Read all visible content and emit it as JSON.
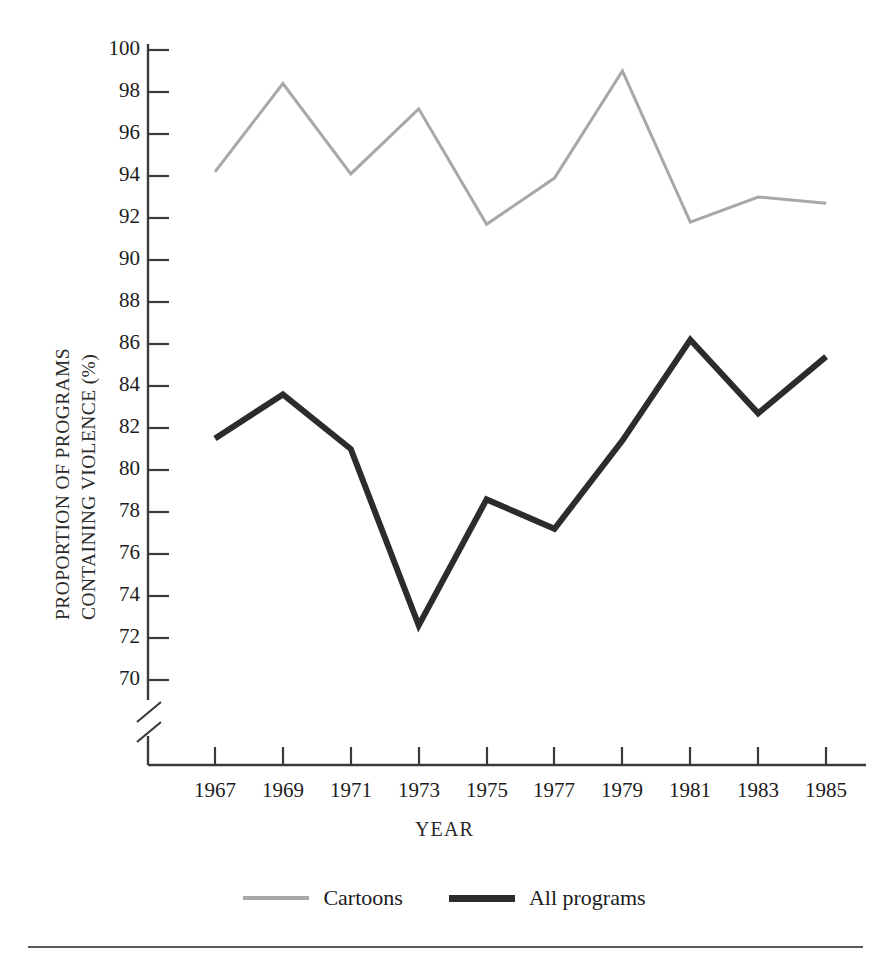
{
  "chart_data": {
    "type": "line",
    "title": "",
    "xlabel": "YEAR",
    "ylabel": "PROPORTION OF PROGRAMS CONTAINING VIOLENCE (%)",
    "ylabel_line1": "PROPORTION OF PROGRAMS",
    "ylabel_line2": "CONTAINING VIOLENCE (%)",
    "x": [
      1967,
      1969,
      1971,
      1973,
      1975,
      1977,
      1979,
      1981,
      1983,
      1985
    ],
    "categories": [
      "1967",
      "1969",
      "1971",
      "1973",
      "1975",
      "1977",
      "1979",
      "1981",
      "1983",
      "1985"
    ],
    "xlim": [
      1967,
      1985
    ],
    "ylim": [
      69,
      100
    ],
    "yticks": [
      70,
      72,
      74,
      76,
      78,
      80,
      82,
      84,
      86,
      88,
      90,
      92,
      94,
      96,
      98,
      100
    ],
    "ytick_labels": [
      "70",
      "72",
      "74",
      "76",
      "78",
      "80",
      "82",
      "84",
      "86",
      "88",
      "90",
      "92",
      "94",
      "96",
      "98",
      "100"
    ],
    "y_axis_break": true,
    "grid": false,
    "legend_position": "bottom-center",
    "series": [
      {
        "name": "Cartoons",
        "color": "#a8a8a8",
        "values": [
          94.2,
          98.4,
          94.1,
          97.2,
          91.7,
          93.9,
          99.0,
          91.8,
          93.0,
          92.7
        ]
      },
      {
        "name": "All programs",
        "color": "#2c2c2c",
        "values": [
          81.5,
          83.6,
          81.0,
          72.6,
          78.6,
          77.2,
          81.4,
          86.2,
          82.7,
          85.4
        ]
      }
    ]
  },
  "legend": {
    "entries": [
      {
        "label": "Cartoons",
        "swatch": "thin-gray-line"
      },
      {
        "label": "All programs",
        "swatch": "thick-dark-line"
      }
    ]
  },
  "colors": {
    "cartoons": "#a8a8a8",
    "all_programs": "#2c2c2c",
    "axis": "#3a3a3a",
    "text": "#1c1c1c",
    "background": "#ffffff"
  }
}
